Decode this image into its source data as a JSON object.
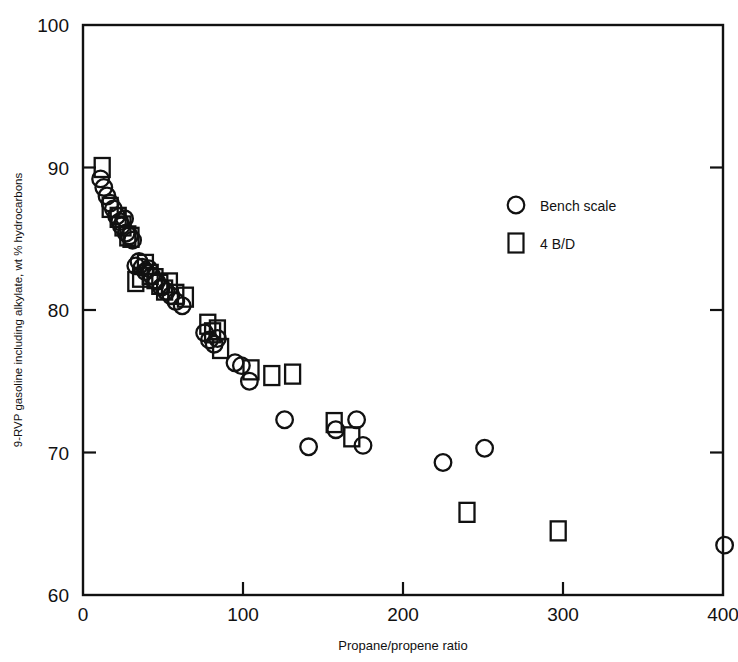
{
  "chart_data": {
    "type": "scatter",
    "title": "",
    "xlabel": "Propane/propene ratio",
    "ylabel": "9-RVP gasoline including alkylate, wt % hydrocarbons",
    "xlim": [
      0,
      400
    ],
    "ylim": [
      60,
      100
    ],
    "xticks": [
      0,
      100,
      200,
      300,
      400
    ],
    "yticks": [
      60,
      70,
      80,
      90,
      100
    ],
    "xtick_labels": [
      "0",
      "100",
      "200",
      "300",
      "400"
    ],
    "ytick_labels": [
      "60",
      "70",
      "80",
      "90",
      "100"
    ],
    "grid": false,
    "legend_position": "upper right",
    "series": [
      {
        "name": "Bench scale",
        "marker": "circle",
        "points": [
          [
            11,
            89.2
          ],
          [
            13,
            88.6
          ],
          [
            15,
            88.0
          ],
          [
            17,
            87.5
          ],
          [
            19,
            87.1
          ],
          [
            21,
            86.6
          ],
          [
            23,
            86.2
          ],
          [
            24,
            85.9
          ],
          [
            26,
            86.4
          ],
          [
            27,
            85.4
          ],
          [
            29,
            85.2
          ],
          [
            31,
            84.9
          ],
          [
            33,
            83.1
          ],
          [
            35,
            83.4
          ],
          [
            37,
            83.0
          ],
          [
            39,
            82.7
          ],
          [
            41,
            82.9
          ],
          [
            43,
            82.4
          ],
          [
            46,
            82.0
          ],
          [
            49,
            81.6
          ],
          [
            52,
            81.3
          ],
          [
            55,
            81.0
          ],
          [
            58,
            80.6
          ],
          [
            62,
            80.3
          ],
          [
            76,
            78.4
          ],
          [
            79,
            77.9
          ],
          [
            82,
            77.6
          ],
          [
            84,
            78.0
          ],
          [
            95,
            76.3
          ],
          [
            99,
            76.1
          ],
          [
            104,
            75.0
          ],
          [
            126,
            72.3
          ],
          [
            141,
            70.4
          ],
          [
            158,
            71.6
          ],
          [
            171,
            72.3
          ],
          [
            175,
            70.5
          ],
          [
            225,
            69.3
          ],
          [
            251,
            70.3
          ],
          [
            401,
            63.5
          ]
        ]
      },
      {
        "name": "4 B/D",
        "marker": "square",
        "points": [
          [
            12,
            90.0
          ],
          [
            17,
            87.2
          ],
          [
            22,
            86.5
          ],
          [
            25,
            85.9
          ],
          [
            28,
            85.2
          ],
          [
            30,
            85.1
          ],
          [
            33,
            82.0
          ],
          [
            36,
            82.3
          ],
          [
            39,
            83.2
          ],
          [
            42,
            82.5
          ],
          [
            45,
            82.2
          ],
          [
            48,
            81.8
          ],
          [
            51,
            81.4
          ],
          [
            54,
            81.9
          ],
          [
            58,
            81.1
          ],
          [
            64,
            80.9
          ],
          [
            78,
            79.0
          ],
          [
            81,
            78.4
          ],
          [
            84,
            78.6
          ],
          [
            86,
            77.3
          ],
          [
            105,
            75.8
          ],
          [
            118,
            75.4
          ],
          [
            131,
            75.5
          ],
          [
            157,
            72.1
          ],
          [
            168,
            71.1
          ],
          [
            240,
            65.8
          ],
          [
            297,
            64.5
          ]
        ]
      }
    ]
  },
  "legend": {
    "entries": [
      {
        "label": "Bench scale",
        "marker": "circle-icon"
      },
      {
        "label": "4 B/D",
        "marker": "square-icon"
      }
    ]
  },
  "axes": {
    "x_title": "Propane/propene ratio",
    "y_title": "9-RVP gasoline including alkylate, wt % hydrocarbons"
  }
}
